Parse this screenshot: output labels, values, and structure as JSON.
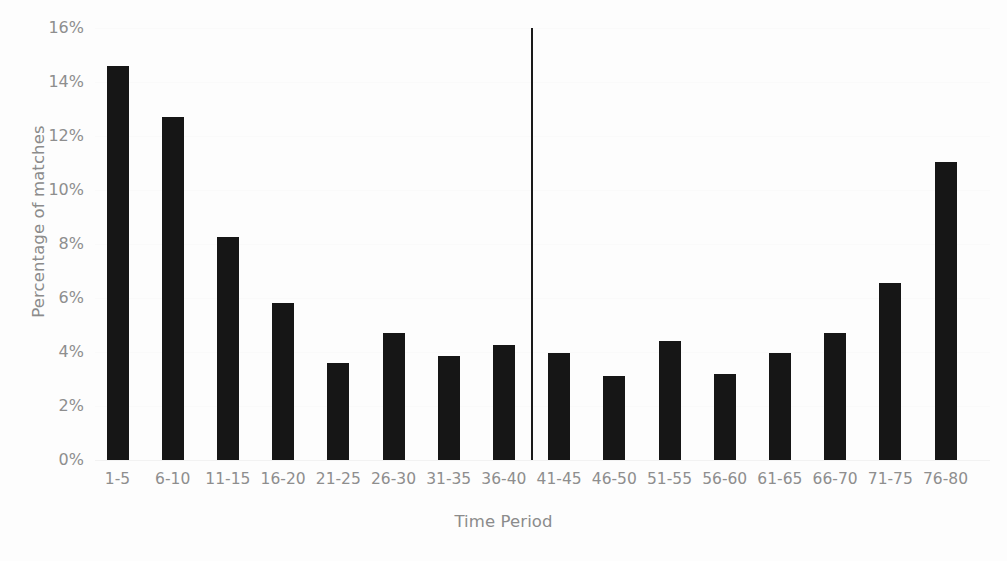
{
  "chart_data": {
    "type": "bar",
    "title": "",
    "xlabel": "Time Period",
    "ylabel": "Percentage of matches",
    "categories": [
      "1-5",
      "6-10",
      "11-15",
      "16-20",
      "21-25",
      "26-30",
      "31-35",
      "36-40",
      "41-45",
      "46-50",
      "51-55",
      "56-60",
      "61-65",
      "66-70",
      "71-75",
      "76-80"
    ],
    "values": [
      14.6,
      12.7,
      8.25,
      5.8,
      3.6,
      4.7,
      3.85,
      4.25,
      3.95,
      3.1,
      4.4,
      3.2,
      3.95,
      4.7,
      6.55,
      11.05
    ],
    "value_labels": [
      "14.6%",
      "12.7%",
      "8.25%",
      "5.8%",
      "3.6%",
      "4.7%",
      "3.85%",
      "4.25%",
      "3.95%",
      "3.1%",
      "4.4%",
      "3.2%",
      "3.95%",
      "4.7%",
      "6.55%",
      "11.05%"
    ],
    "ylim": [
      0,
      16
    ],
    "ytick_values": [
      0,
      2,
      4,
      6,
      8,
      10,
      12,
      14,
      16
    ],
    "ytick_labels": [
      "0%",
      "2%",
      "4%",
      "6%",
      "8%",
      "10%",
      "12%",
      "14%",
      "16%"
    ],
    "grid": true,
    "legend": "none",
    "bar_color": "#161616",
    "axis_label_color": "#8e8e8e",
    "background_color": "#fdfdfd",
    "annotations": [
      {
        "name": "half-time-divider",
        "type": "vertical-line",
        "after_category": "36-40",
        "color": "#1a1a1a"
      }
    ]
  }
}
